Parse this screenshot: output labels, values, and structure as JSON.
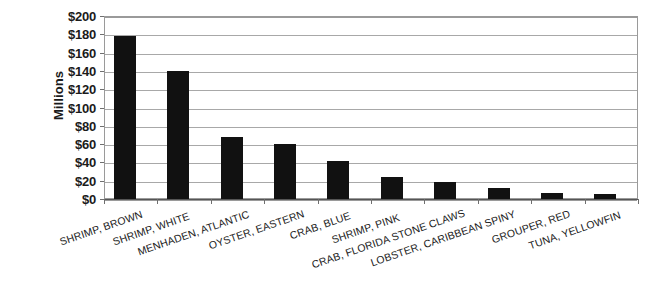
{
  "chart_data": {
    "type": "bar",
    "title": "",
    "subtitle": "",
    "xlabel": "",
    "ylabel": "Millions",
    "ylim": [
      0,
      200
    ],
    "ytick_step": 20,
    "grid": true,
    "legend": false,
    "orientation": "vertical",
    "bar_color": "#111111",
    "value_prefix": "$",
    "categories": [
      "SHRIMP, BROWN",
      "SHRIMP, WHITE",
      "MENHADEN, ATLANTIC",
      "OYSTER, EASTERN",
      "CRAB, BLUE",
      "SHRIMP, PINK",
      "CRAB, FLORIDA STONE CLAWS",
      "LOBSTER, CARIBBEAN SPINY",
      "GROUPER, RED",
      "TUNA, YELLOWFIN"
    ],
    "values": [
      178,
      140,
      68,
      60,
      42,
      24,
      19,
      12,
      7,
      6
    ],
    "ytick_labels": [
      "$200",
      "$180",
      "$160",
      "$140",
      "$120",
      "$100",
      "$80",
      "$60",
      "$40",
      "$20",
      "$0"
    ],
    "ytick_values": [
      200,
      180,
      160,
      140,
      120,
      100,
      80,
      60,
      40,
      20,
      0
    ]
  },
  "colors": {
    "bar": "#111111",
    "gridline": "#a8a8a8",
    "frame": "#9a9a9a",
    "axis": "#555555",
    "text": "#1b1b1b",
    "background": "#ffffff"
  }
}
